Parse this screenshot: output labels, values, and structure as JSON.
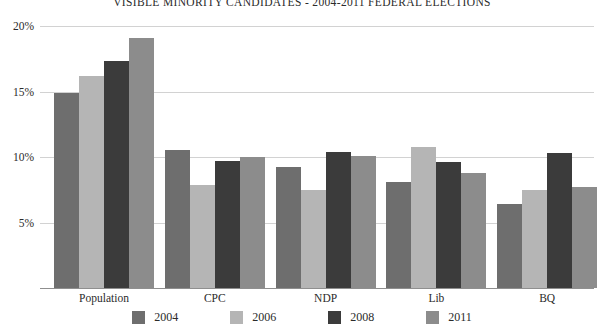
{
  "chart_data": {
    "type": "bar",
    "title": "VISIBLE MINORITY CANDIDATES - 2004-2011 FEDERAL ELECTIONS",
    "xlabel": "",
    "ylabel": "",
    "categories": [
      "Population",
      "CPC",
      "NDP",
      "Lib",
      "BQ"
    ],
    "series": [
      {
        "name": "2004",
        "color": "#6e6e6e",
        "values": [
          14.9,
          10.5,
          9.2,
          8.1,
          6.4
        ]
      },
      {
        "name": "2006",
        "color": "#b5b5b5",
        "values": [
          16.2,
          7.9,
          7.5,
          10.8,
          7.5
        ]
      },
      {
        "name": "2008",
        "color": "#3b3b3b",
        "values": [
          17.3,
          9.7,
          10.4,
          9.6,
          10.3
        ]
      },
      {
        "name": "2011",
        "color": "#8c8c8c",
        "values": [
          19.1,
          10.0,
          10.1,
          8.8,
          7.7
        ]
      }
    ],
    "ylim": [
      0,
      20
    ],
    "yticks": [
      5,
      10,
      15,
      20
    ],
    "ytick_labels": [
      "5%",
      "10%",
      "15%",
      "20%"
    ],
    "grid": true,
    "legend_position": "bottom",
    "axis_color": "#d2d2d2",
    "baseline_color": "#8f8f8f",
    "text_color": "#2b2b2b"
  }
}
